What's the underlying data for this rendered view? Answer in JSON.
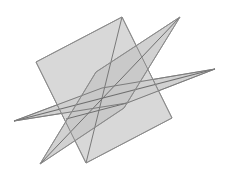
{
  "figure": {
    "type": "geometric-diagram",
    "canvas": {
      "width": 229,
      "height": 177,
      "background": "#ffffff"
    },
    "style": {
      "plane_fill": "#cccccc",
      "plane_fill_opacity": 0.72,
      "overlap_fill": "#b4b4b4",
      "edge_color": "#777777",
      "edge_width": 1,
      "intersection_line_color": "#6e6e6e",
      "intersection_line_width": 1.1
    },
    "shapes": [
      {
        "name": "horizontal-plane",
        "label": "Horizontal plane (wide, shallow parallelogram)",
        "points": "14,121 102,88 215,69 127,103",
        "fill": "#c9c9c9",
        "opacity": 0.85
      },
      {
        "name": "inclined-plane",
        "label": "Inclined plane (tall parallelogram, upper-left to lower-right)",
        "points": "122,17 36,62 86,163 172,118",
        "fill": "#cfcfcf",
        "opacity": 0.82
      },
      {
        "name": "steep-plane",
        "label": "Steep plane (narrow parallelogram, upper-right spike)",
        "points": "180,17 96,72 40,164 124,108",
        "fill": "#c6c6c6",
        "opacity": 0.8
      }
    ],
    "intersection_lines": [
      {
        "name": "intersection-line-horizontal-inclined",
        "from": "14,121",
        "to": "215,69"
      },
      {
        "name": "intersection-line-inclined-steep",
        "from": "180,17",
        "to": "40,164"
      },
      {
        "name": "intersection-line-center",
        "from": "122,17",
        "to": "86,163"
      }
    ],
    "vertices": [
      {
        "name": "vertex-top-left",
        "x": 122,
        "y": 17
      },
      {
        "name": "vertex-top-right-spike",
        "x": 180,
        "y": 17
      },
      {
        "name": "vertex-left",
        "x": 36,
        "y": 62
      },
      {
        "name": "vertex-right",
        "x": 215,
        "y": 69
      },
      {
        "name": "vertex-left-tip",
        "x": 14,
        "y": 121
      },
      {
        "name": "vertex-bottom-right",
        "x": 172,
        "y": 118
      },
      {
        "name": "vertex-bottom-left-spike",
        "x": 40,
        "y": 164
      },
      {
        "name": "vertex-bottom",
        "x": 86,
        "y": 163
      },
      {
        "name": "vertex-center-intersection",
        "x": 66,
        "y": 119
      }
    ]
  }
}
